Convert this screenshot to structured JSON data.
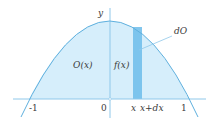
{
  "figure": {
    "axis_labels": {
      "y": "y"
    },
    "ticks": {
      "neg_one": "-1",
      "zero": "0",
      "one": "1"
    },
    "strip_labels": {
      "x": "x",
      "x_plus_dx": "x+dx"
    },
    "region_label": "O(x)",
    "height_label": "f(x)",
    "strip_area_label": "dO",
    "colors": {
      "curve": "#5fb0de",
      "fill": "#d6eefb",
      "strip": "#6cbcea",
      "axis": "#8fc8ea",
      "text": "#3a3a3a"
    }
  }
}
